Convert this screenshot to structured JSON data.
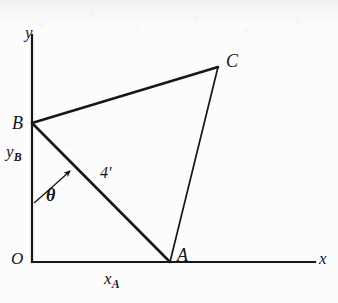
{
  "figure": {
    "kind": "geometry-diagram",
    "background_color": "#fcfcfc",
    "ink_color": "#17171a",
    "width": 338,
    "height": 303
  },
  "axes": {
    "origin_label": "O",
    "x_axis_label": "x",
    "y_axis_label": "y",
    "origin": {
      "x": 32,
      "y": 262
    },
    "x_axis_end": {
      "x": 315,
      "y": 262
    },
    "y_axis_end": {
      "x": 32,
      "y": 35
    },
    "stroke_width": 2.2
  },
  "vertices": [
    {
      "id": "A",
      "label": "A",
      "x": 170,
      "y": 262,
      "label_x": 177,
      "label_y": 246
    },
    {
      "id": "B",
      "label": "B",
      "x": 32,
      "y": 123,
      "label_x": 12,
      "label_y": 114
    },
    {
      "id": "C",
      "label": "C",
      "x": 218,
      "y": 67,
      "label_x": 226,
      "label_y": 52
    }
  ],
  "edges": [
    {
      "id": "BC",
      "from": "B",
      "to": "C",
      "stroke_width": 2.6
    },
    {
      "id": "CA",
      "from": "C",
      "to": "A",
      "stroke_width": 1.7
    },
    {
      "id": "BA",
      "from": "B",
      "to": "A",
      "stroke_width": 2.6
    }
  ],
  "annotations": {
    "segment_length": {
      "text": "4'",
      "x": 100,
      "y": 165
    },
    "angle": {
      "symbol": "θ",
      "x": 46,
      "y": 186,
      "vertex": "B",
      "arc_from": "y-axis",
      "arc_to": "segment-BA"
    },
    "y_intercept": {
      "base": "y",
      "subscript": "B",
      "x": 6,
      "y": 143
    },
    "x_intercept": {
      "base": "x",
      "subscript": "A",
      "x": 104,
      "y": 270
    }
  }
}
